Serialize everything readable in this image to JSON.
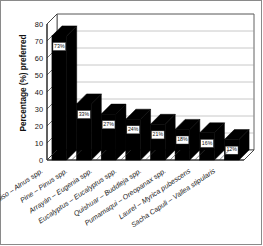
{
  "chart_data": {
    "type": "bar",
    "title": "",
    "subtitle": "",
    "xlabel": "",
    "ylabel": "Percentage (%) preferred",
    "ylim": [
      0,
      80
    ],
    "yticks": [
      0,
      10,
      20,
      30,
      40,
      50,
      60,
      70,
      80
    ],
    "ytick_labels": [
      "0",
      "10",
      "20",
      "30",
      "40",
      "50",
      "60",
      "70",
      "80"
    ],
    "grid": true,
    "grid_axis": "y",
    "legend": false,
    "legend_position": "none",
    "style": "3d-column",
    "bar_color": "#000000",
    "categories": [
      "Aliso – Alnus spp.",
      "Pine – Pinus spp.",
      "Arrayán – Eugenia spp.",
      "Eucalyptus – Eucalyptus spp.",
      "Quishuar – Buddleja spp.",
      "Pumamaqui – Oreopanax spp.",
      "Laurel – Myrica pubescens",
      "Sacha Capuli – Vallea stipularis"
    ],
    "values": [
      73,
      33,
      27,
      24,
      21,
      18,
      16,
      12
    ],
    "data_labels": [
      "73%",
      "33%",
      "27%",
      "24%",
      "21%",
      "18%",
      "16%",
      "12%"
    ]
  }
}
